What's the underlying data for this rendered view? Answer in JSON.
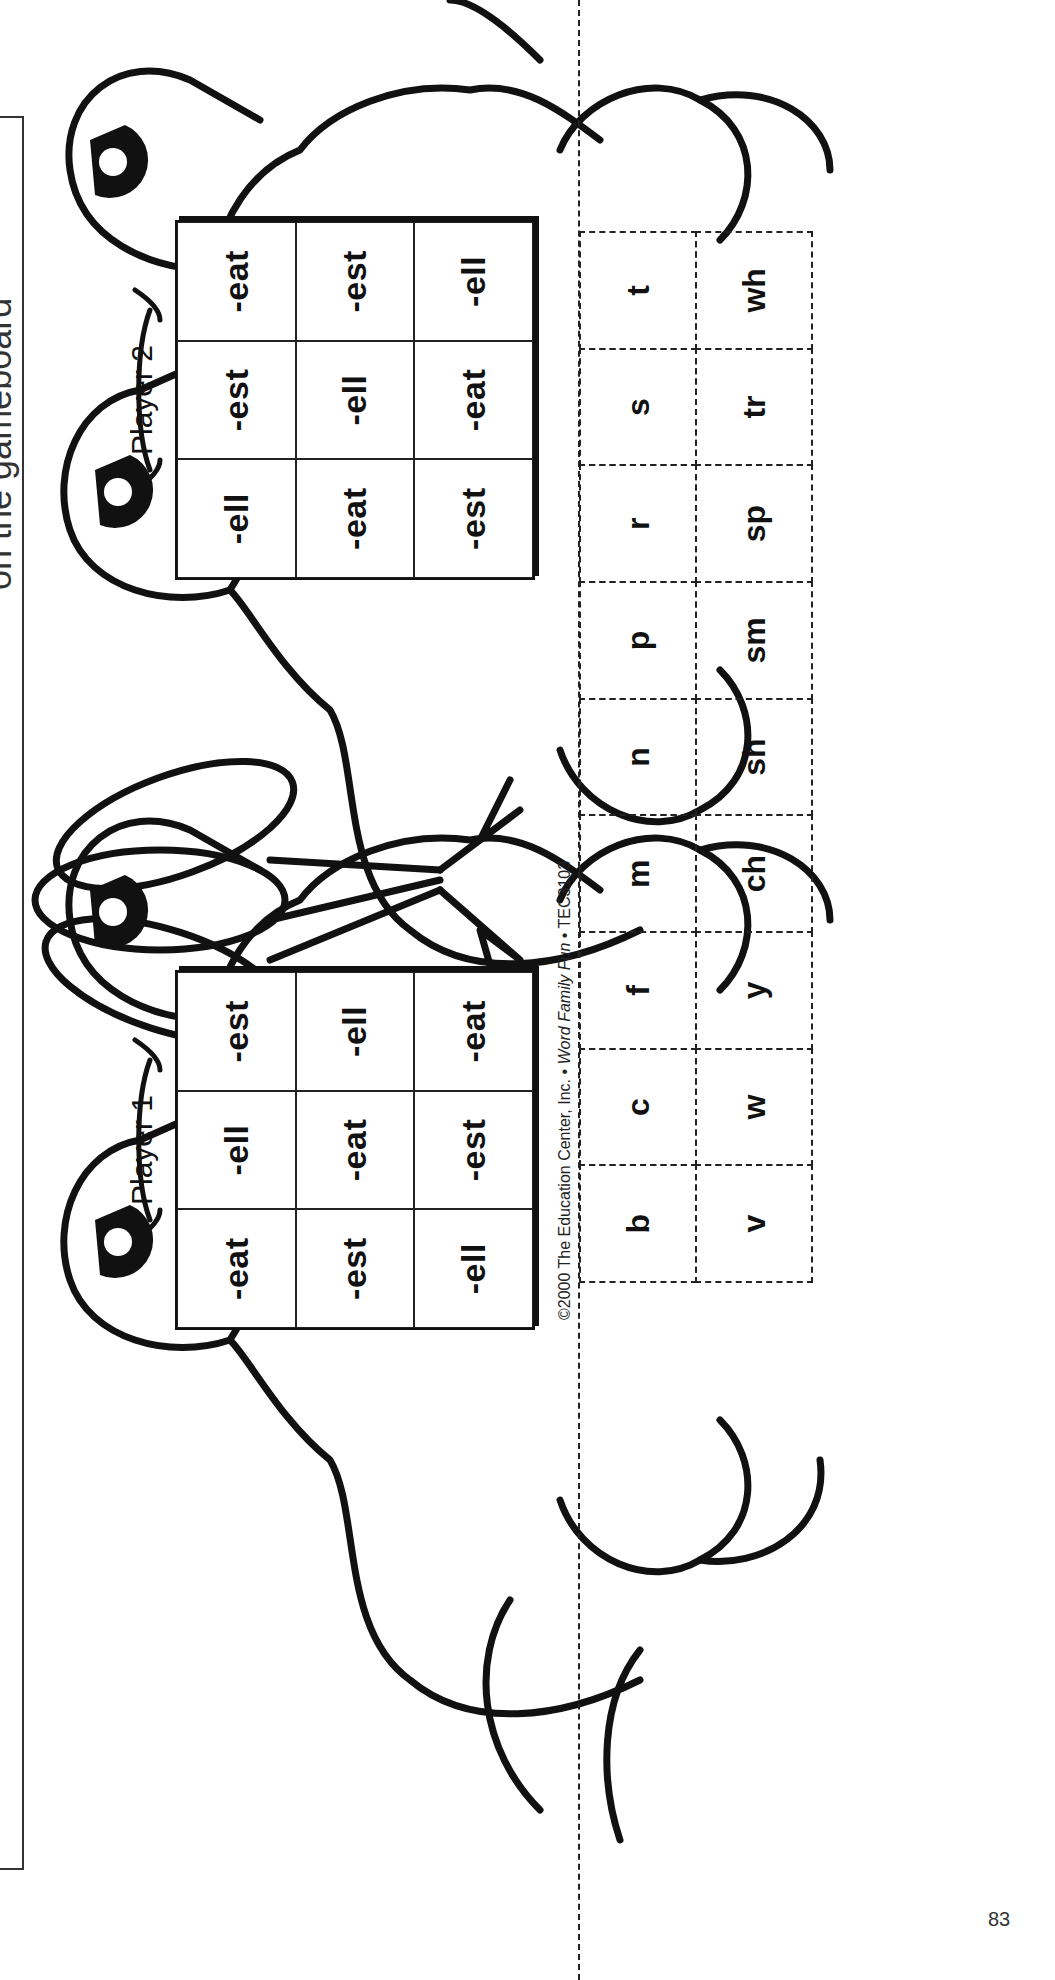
{
  "instruction_box": {
    "text": "on the gameboard"
  },
  "players": [
    {
      "label": "Player 1",
      "grid": [
        [
          "-eat",
          "-ell",
          "-est"
        ],
        [
          "-est",
          "-eat",
          "-ell"
        ],
        [
          "-ell",
          "-est",
          "-eat"
        ]
      ]
    },
    {
      "label": "Player 2",
      "grid": [
        [
          "-ell",
          "-est",
          "-eat"
        ],
        [
          "-eat",
          "-ell",
          "-est"
        ],
        [
          "-est",
          "-eat",
          "-ell"
        ]
      ]
    }
  ],
  "letter_cards": {
    "row1": [
      "b",
      "c",
      "f",
      "m",
      "n",
      "p",
      "r",
      "s",
      "t"
    ],
    "row2": [
      "v",
      "w",
      "y",
      "ch",
      "sh",
      "sm",
      "sp",
      "tr",
      "wh"
    ]
  },
  "copyright": {
    "prefix": "©2000 The Education Center, Inc. • ",
    "title": "Word Family Fun",
    "suffix": " • TEC3103"
  },
  "page_number": "83",
  "colors": {
    "ink": "#111111",
    "paper": "#ffffff"
  }
}
